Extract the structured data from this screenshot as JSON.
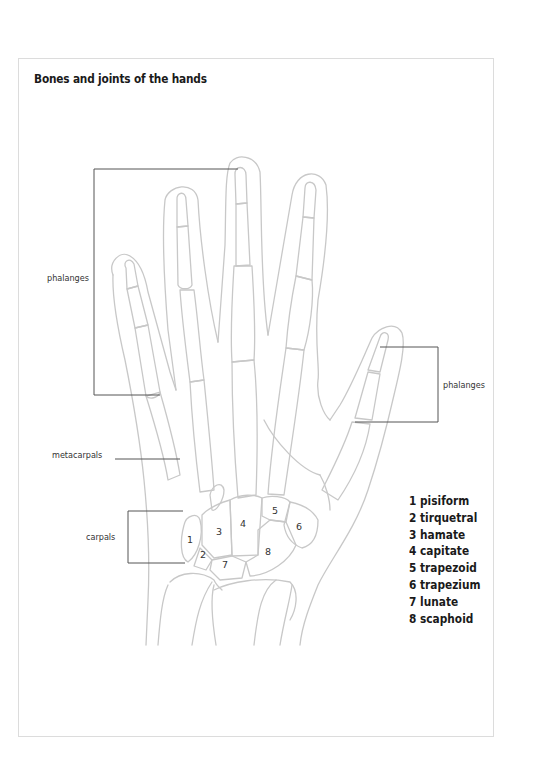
{
  "title": "Bones and joints of the hands",
  "labels": {
    "phalanges_left": "phalanges",
    "phalanges_right": "phalanges",
    "metacarpals": "metacarpals",
    "carpals": "carpals"
  },
  "carpal_numbers": [
    "1",
    "2",
    "3",
    "4",
    "5",
    "6",
    "7",
    "8"
  ],
  "legend": [
    "1 pisiform",
    "2 tirquetral",
    "3 hamate",
    "4 capitate",
    "5 trapezoid",
    "6 trapezium",
    "7 lunate",
    "8 scaphoid"
  ],
  "colors": {
    "outline": "#c8c8c8",
    "leader": "#555555",
    "text": "#1a1a1a",
    "frame": "#dcdcdc"
  }
}
